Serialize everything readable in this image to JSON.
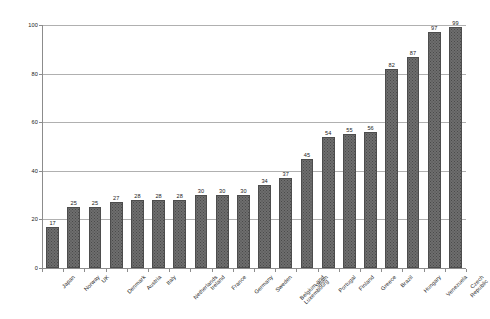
{
  "chart_data": {
    "type": "bar",
    "title": "",
    "subtitle": "",
    "xlabel": "",
    "ylabel": "",
    "ylim": [
      0,
      100
    ],
    "yticks": [
      0,
      20,
      40,
      60,
      80,
      100
    ],
    "ytick_labels": [
      "0",
      "20",
      "40",
      "60",
      "80",
      "100"
    ],
    "grid": true,
    "gridlines": "horizontal",
    "legend": "none",
    "categories": [
      "Japan",
      "Norway",
      "UK",
      "Denmark",
      "Austria",
      "Italy",
      "Netherlands",
      "Ireland",
      "France",
      "Germany",
      "Sweden",
      "Belgium and\nLuxembourg",
      "Spain",
      "Portugal",
      "Finland",
      "Greece",
      "Brazil",
      "Hungary",
      "Venezuela",
      "Czech Republic"
    ],
    "values": [
      17,
      25,
      25,
      27,
      28,
      28,
      28,
      30,
      30,
      30,
      34,
      37,
      45,
      54,
      55,
      56,
      82,
      87,
      97,
      99
    ],
    "value_labels": [
      "17",
      "25",
      "25",
      "27",
      "28",
      "28",
      "28",
      "30",
      "30",
      "30",
      "34",
      "37",
      "45",
      "54",
      "55",
      "56",
      "82",
      "87",
      "97",
      "99"
    ],
    "colors": {
      "bar_fill": "#6e6e6e",
      "bar_pattern_dot": "#4a4a4a",
      "bar_border": "#4d4d4d",
      "gridline": "#b0b0b0",
      "axis": "#8c8c8c",
      "text": "#1a1a1a",
      "background": "#ffffff"
    }
  }
}
